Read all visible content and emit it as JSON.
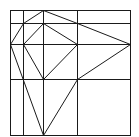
{
  "figure": {
    "type": "geometric-line-diagram",
    "stroke_color": "#1a1a1a",
    "background": "#ffffff",
    "outer_square": {
      "x1": 10,
      "y1": 10,
      "x2": 130,
      "y2": 135
    },
    "vertical_lines_x": [
      23,
      43,
      77
    ],
    "horizontal_lines_y": [
      23,
      44,
      79
    ],
    "segments": [
      [
        10,
        44,
        23,
        23
      ],
      [
        23,
        23,
        43,
        10
      ],
      [
        43,
        10,
        77,
        23
      ],
      [
        77,
        23,
        130,
        44
      ],
      [
        130,
        44,
        77,
        79
      ],
      [
        23,
        44,
        43,
        23
      ],
      [
        43,
        23,
        77,
        44
      ],
      [
        77,
        44,
        43,
        79
      ],
      [
        43,
        79,
        23,
        44
      ],
      [
        10,
        44,
        43,
        135
      ],
      [
        43,
        135,
        77,
        79
      ]
    ]
  }
}
